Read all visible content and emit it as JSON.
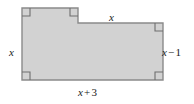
{
  "figure": {
    "name": "L-shaped polygon with labeled side lengths",
    "fill_color": "#d2d2d2",
    "stroke_color": "#8a8a8a",
    "background_color": "#ffffff",
    "label_color": "#1a1a1a",
    "polygon_points": "22,8 78,8 78,23 163,23 163,80 22,80",
    "right_angle_marks": [
      {
        "name": "top-left-corner",
        "x": 22,
        "y": 8,
        "dx": 1,
        "dy": 1
      },
      {
        "name": "notch-corner",
        "x": 78,
        "y": 8,
        "dx": -1,
        "dy": 1
      },
      {
        "name": "right-step-corner",
        "x": 163,
        "y": 23,
        "dx": -1,
        "dy": 1
      },
      {
        "name": "bottom-right-corner",
        "x": 163,
        "y": 80,
        "dx": -1,
        "dy": -1
      },
      {
        "name": "bottom-left-corner",
        "x": 22,
        "y": 80,
        "dx": 1,
        "dy": -1
      }
    ],
    "labels": {
      "left": {
        "variable": "x",
        "operator": "",
        "constant": ""
      },
      "top": {
        "variable": "x",
        "operator": "",
        "constant": ""
      },
      "right": {
        "variable": "x",
        "operator": "−",
        "constant": "1"
      },
      "bottom": {
        "variable": "x",
        "operator": "+",
        "constant": "3"
      }
    }
  }
}
